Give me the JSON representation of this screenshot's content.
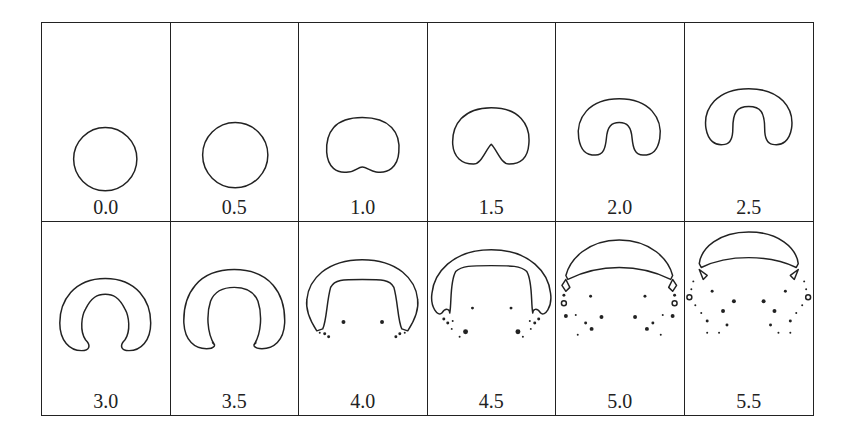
{
  "figure": {
    "rows": 2,
    "columns": 6,
    "panels": [
      {
        "label": "0.0",
        "shape": "circle"
      },
      {
        "label": "0.5",
        "shape": "circle"
      },
      {
        "label": "1.0",
        "shape": "kidney with small bottom indentation"
      },
      {
        "label": "1.5",
        "shape": "bean with central notch"
      },
      {
        "label": "2.0",
        "shape": "horseshoe"
      },
      {
        "label": "2.5",
        "shape": "deeper horseshoe"
      },
      {
        "label": "3.0",
        "shape": "open crescent ring"
      },
      {
        "label": "3.5",
        "shape": "crescent with pointed tips"
      },
      {
        "label": "4.0",
        "shape": "wide arch with satellite droplets"
      },
      {
        "label": "4.5",
        "shape": "arch with curled tips and droplets"
      },
      {
        "label": "5.0",
        "shape": "cap with fragmented sides and scattered droplets"
      },
      {
        "label": "5.5",
        "shape": "cap detached with scattered droplets"
      }
    ]
  }
}
